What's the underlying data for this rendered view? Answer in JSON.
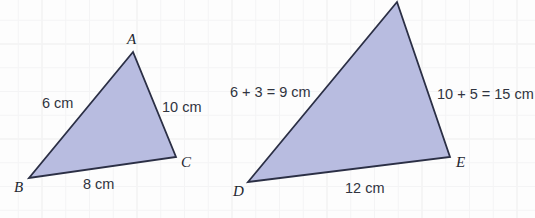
{
  "figure": {
    "background_color": "#fdfdfd",
    "grid_color": "#ececed",
    "shape_fill": "#b8bce0",
    "shape_stroke": "#2b2f45"
  },
  "triangles": [
    {
      "id": "triangle-abc",
      "vertices": [
        {
          "label": "A",
          "x": 133,
          "y": 52,
          "label_x": 127,
          "label_y": 32
        },
        {
          "label": "B",
          "x": 29,
          "y": 178,
          "label_x": 14,
          "label_y": 180
        },
        {
          "label": "C",
          "x": 176,
          "y": 157,
          "label_x": 181,
          "label_y": 155
        }
      ],
      "sides": [
        {
          "name": "side-ab",
          "text": "6 cm",
          "x": 42,
          "y": 96
        },
        {
          "name": "side-ac",
          "text": "10 cm",
          "x": 162,
          "y": 100
        },
        {
          "name": "side-bc",
          "text": "8 cm",
          "x": 83,
          "y": 177
        }
      ]
    },
    {
      "id": "triangle-def",
      "vertices": [
        {
          "label": "F",
          "x": 397,
          "y": 2,
          "label_x": 390,
          "label_y": -13
        },
        {
          "label": "D",
          "x": 248,
          "y": 182,
          "label_x": 233,
          "label_y": 184
        },
        {
          "label": "E",
          "x": 450,
          "y": 157,
          "label_x": 456,
          "label_y": 155
        }
      ],
      "sides": [
        {
          "name": "side-df",
          "text": "6 + 3 = 9 cm",
          "x": 230,
          "y": 85
        },
        {
          "name": "side-fe",
          "text": "10 + 5 = 15 cm",
          "x": 437,
          "y": 87
        },
        {
          "name": "side-de",
          "text": "12 cm",
          "x": 345,
          "y": 181
        }
      ]
    }
  ]
}
